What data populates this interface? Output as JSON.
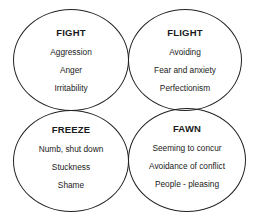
{
  "diagram": {
    "quadrants": [
      {
        "title": "FIGHT",
        "items": [
          "Aggression",
          "Anger",
          "Irritability"
        ]
      },
      {
        "title": "FLIGHT",
        "items": [
          "Avoiding",
          "Fear and anxiety",
          "Perfectionism"
        ]
      },
      {
        "title": "FREEZE",
        "items": [
          "Numb, shut down",
          "Stuckness",
          "Shame"
        ]
      },
      {
        "title": "FAWN",
        "items": [
          "Seeming to concur",
          "Avoidance of conflict",
          "People - pleasing"
        ]
      }
    ],
    "colors": {
      "stroke": "#222222",
      "text": "#1a1a1a",
      "background": "#ffffff"
    }
  }
}
